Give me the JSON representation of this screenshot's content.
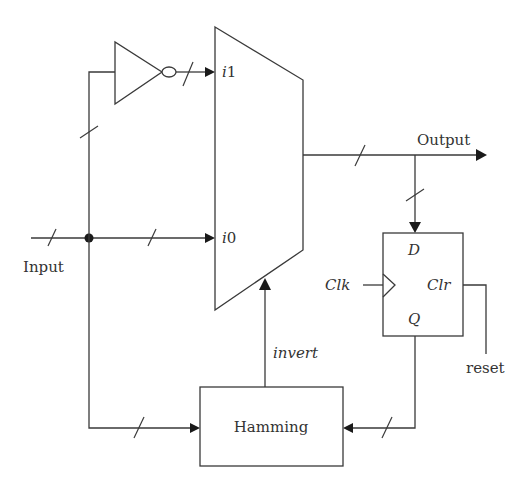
{
  "diagram": {
    "type": "block-diagram",
    "title": "",
    "colors": {
      "stroke": "#3a3a3a",
      "arrow": "#1a1a1a",
      "text": "#333333",
      "background": "#ffffff"
    },
    "labels": {
      "input": "Input",
      "output": "Output",
      "mux_i1": "i1",
      "mux_i0": "i0",
      "invert": "invert",
      "hamming": "Hamming",
      "ff_d": "D",
      "ff_clk": "Clk",
      "ff_clr": "Clr",
      "ff_q": "Q",
      "reset": "reset"
    },
    "nodes": [
      {
        "id": "inverter",
        "kind": "NOT gate"
      },
      {
        "id": "mux",
        "kind": "2-to-1 multiplexer",
        "inputs": [
          "i1",
          "i0"
        ],
        "select": "invert"
      },
      {
        "id": "flipflop",
        "kind": "D flip-flop",
        "ports": [
          "D",
          "Clk",
          "Clr",
          "Q"
        ]
      },
      {
        "id": "hamming",
        "kind": "block",
        "label": "Hamming"
      }
    ],
    "edges": [
      {
        "from": "Input",
        "to": "mux.i0",
        "bus": true
      },
      {
        "from": "Input",
        "to": "inverter",
        "bus": true
      },
      {
        "from": "inverter",
        "to": "mux.i1",
        "bus": true
      },
      {
        "from": "Input",
        "to": "hamming",
        "bus": true
      },
      {
        "from": "mux",
        "to": "Output",
        "bus": true
      },
      {
        "from": "mux",
        "to": "flipflop.D",
        "bus": true
      },
      {
        "from": "flipflop.Q",
        "to": "hamming",
        "bus": true
      },
      {
        "from": "hamming",
        "to": "mux.select",
        "label": "invert"
      },
      {
        "from": "Clk",
        "to": "flipflop.Clk"
      },
      {
        "from": "reset",
        "to": "flipflop.Clr"
      }
    ]
  }
}
